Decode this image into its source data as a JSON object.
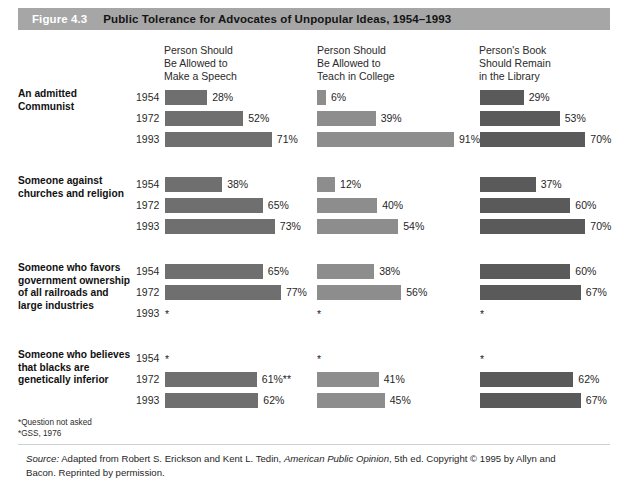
{
  "figure": {
    "number": "Figure 4.3",
    "title": "Public Tolerance for Advocates of Unpopular Ideas, 1954–1993"
  },
  "columns": [
    {
      "header": "Person Should\nBe Allowed to\nMake a Speech",
      "tone": "tone-dark"
    },
    {
      "header": "Person Should\nBe Allowed to\nTeach in College",
      "tone": "tone-light"
    },
    {
      "header": "Person's Book\nShould Remain\nin the Library",
      "tone": "tone-darker"
    }
  ],
  "footnotes": [
    "*Question not asked",
    "*GSS, 1976"
  ],
  "source": {
    "prefix": "Source:",
    "text_before_italic": " Adapted from Robert S. Erickson and Kent L. Tedin, ",
    "italic": "American Public Opinion",
    "text_after_italic": ", 5th ed. Copyright © 1995 by Allyn and Bacon. Reprinted by permission."
  },
  "chart_data": {
    "type": "bar",
    "title": "Public Tolerance for Advocates of Unpopular Ideas, 1954–1993",
    "xlabel": "",
    "ylabel": "",
    "xlim": [
      0,
      100
    ],
    "grid": false,
    "legend": "none",
    "units": "percent",
    "column_headers": [
      "Person Should Be Allowed to Make a Speech",
      "Person Should Be Allowed to Teach in College",
      "Person's Book Should Remain in the Library"
    ],
    "years": [
      "1954",
      "1972",
      "1993"
    ],
    "groups": [
      {
        "label": "An admitted Communist",
        "rows": [
          {
            "year": "1954",
            "values": [
              28,
              6,
              29
            ],
            "labels": [
              "28%",
              "6%",
              "29%"
            ]
          },
          {
            "year": "1972",
            "values": [
              52,
              39,
              53
            ],
            "labels": [
              "52%",
              "39%",
              "53%"
            ]
          },
          {
            "year": "1993",
            "values": [
              71,
              91,
              70
            ],
            "labels": [
              "71%",
              "91%",
              "70%"
            ]
          }
        ]
      },
      {
        "label": "Someone against churches and religion",
        "rows": [
          {
            "year": "1954",
            "values": [
              38,
              12,
              37
            ],
            "labels": [
              "38%",
              "12%",
              "37%"
            ]
          },
          {
            "year": "1972",
            "values": [
              65,
              40,
              60
            ],
            "labels": [
              "65%",
              "40%",
              "60%"
            ]
          },
          {
            "year": "1993",
            "values": [
              73,
              54,
              70
            ],
            "labels": [
              "73%",
              "54%",
              "70%"
            ]
          }
        ]
      },
      {
        "label": "Someone who favors government ownership of all railroads and large industries",
        "rows": [
          {
            "year": "1954",
            "values": [
              65,
              38,
              60
            ],
            "labels": [
              "65%",
              "38%",
              "60%"
            ]
          },
          {
            "year": "1972",
            "values": [
              77,
              56,
              67
            ],
            "labels": [
              "77%",
              "56%",
              "67%"
            ]
          },
          {
            "year": "1993",
            "values": [
              null,
              null,
              null
            ],
            "labels": [
              "*",
              "*",
              "*"
            ]
          }
        ]
      },
      {
        "label": "Someone who believes that blacks are genetically inferior",
        "rows": [
          {
            "year": "1954",
            "values": [
              null,
              null,
              null
            ],
            "labels": [
              "*",
              "*",
              "*"
            ]
          },
          {
            "year": "1972",
            "values": [
              61,
              41,
              62
            ],
            "labels": [
              "61%**",
              "41%",
              "62%"
            ]
          },
          {
            "year": "1993",
            "values": [
              62,
              45,
              67
            ],
            "labels": [
              "62%",
              "45%",
              "67%"
            ]
          }
        ]
      }
    ]
  }
}
